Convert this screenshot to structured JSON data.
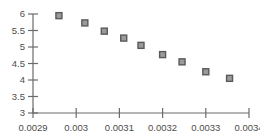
{
  "chart_data": {
    "type": "scatter",
    "title": "",
    "xlabel": "",
    "ylabel": "",
    "xlim": [
      0.0029,
      0.0034
    ],
    "ylim": [
      3,
      6
    ],
    "grid": false,
    "legend": null,
    "xticks": [
      "0.0029",
      "0.003",
      "0.0031",
      "0.0032",
      "0.0033",
      "0.0034"
    ],
    "xtick_values": [
      0.0029,
      0.003,
      0.0031,
      0.0032,
      0.0033,
      0.0034
    ],
    "yticks": [
      "6",
      "5.5",
      "5",
      "4.5",
      "4",
      "3.5",
      "3"
    ],
    "ytick_values": [
      6,
      5.5,
      5,
      4.5,
      4,
      3.5,
      3
    ],
    "series": [
      {
        "name": "series-1",
        "marker": "square",
        "marker_fill": "#9a9a9a",
        "marker_edge": "#5a5a5a",
        "points": [
          {
            "x": 0.00296,
            "y": 5.95
          },
          {
            "x": 0.00302,
            "y": 5.73
          },
          {
            "x": 0.003065,
            "y": 5.48
          },
          {
            "x": 0.00311,
            "y": 5.27
          },
          {
            "x": 0.00315,
            "y": 5.05
          },
          {
            "x": 0.0032,
            "y": 4.77
          },
          {
            "x": 0.003245,
            "y": 4.55
          },
          {
            "x": 0.0033,
            "y": 4.25
          },
          {
            "x": 0.003355,
            "y": 4.05
          }
        ]
      }
    ]
  },
  "style": {
    "axis_color": "#6b6b6b",
    "text_color": "#4d4d4d",
    "background": "#ffffff"
  }
}
